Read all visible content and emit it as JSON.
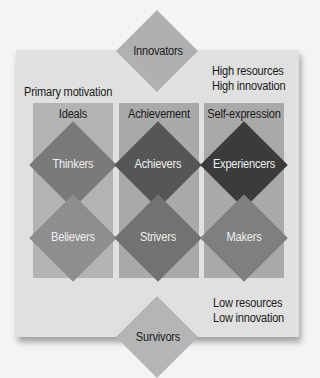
{
  "diagram": {
    "top_node": {
      "label": "Innovators",
      "color": "#b0b0b0"
    },
    "bottom_node": {
      "label": "Survivors",
      "color": "#b5b5b5"
    },
    "high_note": {
      "line1": "High resources",
      "line2": "High innovation"
    },
    "low_note": {
      "line1": "Low resources",
      "line2": "Low innovation"
    },
    "motivation_label": "Primary motivation",
    "columns": [
      {
        "label": "Ideals",
        "upper": {
          "label": "Thinkers",
          "color": "#7a7a7a"
        },
        "lower": {
          "label": "Believers",
          "color": "#8e8e8e"
        }
      },
      {
        "label": "Achievement",
        "upper": {
          "label": "Achievers",
          "color": "#565656"
        },
        "lower": {
          "label": "Strivers",
          "color": "#727272"
        }
      },
      {
        "label": "Self-expression",
        "upper": {
          "label": "Experiencers",
          "color": "#3b3b3b"
        },
        "lower": {
          "label": "Makers",
          "color": "#7f7f7f"
        }
      }
    ],
    "colors": {
      "panel": "#e0e0e0",
      "column": "#a9a9a9",
      "background": "#f4f4f4"
    }
  }
}
